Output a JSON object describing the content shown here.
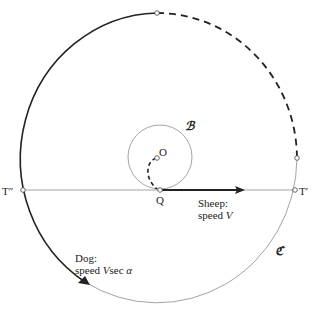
{
  "diagram": {
    "points": {
      "O": "O",
      "Q": "Q",
      "T_prime": "T′",
      "T_double_prime": "T″"
    },
    "circles": {
      "small": "ℬ",
      "large": "ℭ"
    },
    "sheep": {
      "line1": "Sheep:",
      "line2_prefix": "speed ",
      "line2_var": "V"
    },
    "dog": {
      "line1": "Dog:",
      "line2_prefix": "speed ",
      "line2_var": "V",
      "line2_mid": "sec ",
      "line2_angle": "α"
    },
    "colors": {
      "ink": "#222222",
      "thin": "#888888"
    }
  }
}
